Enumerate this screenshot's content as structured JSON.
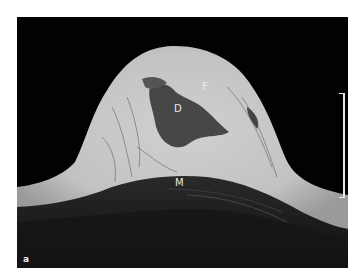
{
  "figure": {
    "panel_letter": "a",
    "labels": {
      "fat": "F",
      "ducts": "D",
      "muscle": "M"
    },
    "colors": {
      "background": "#020202",
      "tissue": "#c4c4c4",
      "gland": "#3e3e3e",
      "muscle": "#1e1e1e",
      "label": "#e8e8e8"
    }
  }
}
